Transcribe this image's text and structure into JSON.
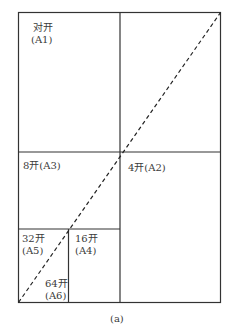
{
  "diagram": {
    "caption": "(a)",
    "sheets": [
      {
        "id": "A1",
        "label_line1": "对开",
        "label_line2": "(A1)"
      },
      {
        "id": "A2",
        "label": "4开(A2)"
      },
      {
        "id": "A3",
        "label": "8开(A3)"
      },
      {
        "id": "A4",
        "label_line1": "16开",
        "label_line2": "(A4)"
      },
      {
        "id": "A5",
        "label_line1": "32开",
        "label_line2": "(A5)"
      },
      {
        "id": "A6",
        "label_line1": "64开",
        "label_line2": "(A6)"
      }
    ],
    "colors": {
      "line": "#333333",
      "background": "#ffffff"
    }
  }
}
